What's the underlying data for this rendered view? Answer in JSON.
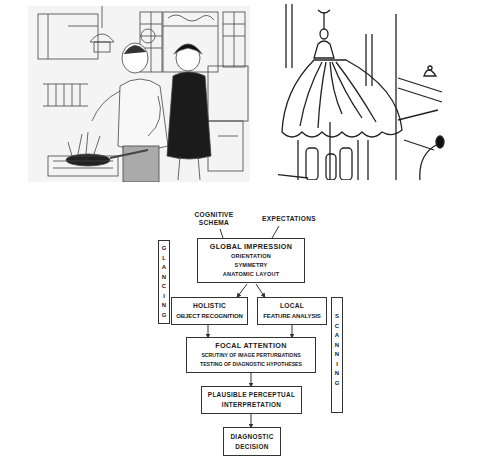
{
  "illustrations": {
    "left": "cartoon-couple-cooking-kitchen",
    "right": "cartoon-hanging-lamp-detail"
  },
  "diagram": {
    "inputs": {
      "cognitive_schema": [
        "COGNITIVE",
        "SCHEMA"
      ],
      "expectations": "EXPECTATIONS"
    },
    "global_impression": {
      "title": "GLOBAL IMPRESSION",
      "lines": [
        "ORIENTATION",
        "SYMMETRY",
        "ANATOMIC LAYOUT"
      ]
    },
    "holistic": {
      "lines": [
        "HOLISTIC",
        "OBJECT RECOGNITION"
      ]
    },
    "local": {
      "lines": [
        "LOCAL",
        "FEATURE ANALYSIS"
      ]
    },
    "focal_attention": {
      "title": "FOCAL ATTENTION",
      "lines": [
        "SCRUTINY OF IMAGE PERTURBATIONS",
        "TESTING OF DIAGNOSTIC HYPOTHESES"
      ]
    },
    "plausible": {
      "lines": [
        "PLAUSIBLE PERCEPTUAL",
        "INTERPRETATION"
      ]
    },
    "decision": {
      "lines": [
        "DIAGNOSTIC",
        "DECISION"
      ]
    },
    "side_labels": {
      "glancing": [
        "G",
        "L",
        "A",
        "N",
        "C",
        "I",
        "N",
        "G"
      ],
      "scanning": [
        "S",
        "C",
        "A",
        "N",
        "N",
        "I",
        "N",
        "G"
      ]
    }
  }
}
